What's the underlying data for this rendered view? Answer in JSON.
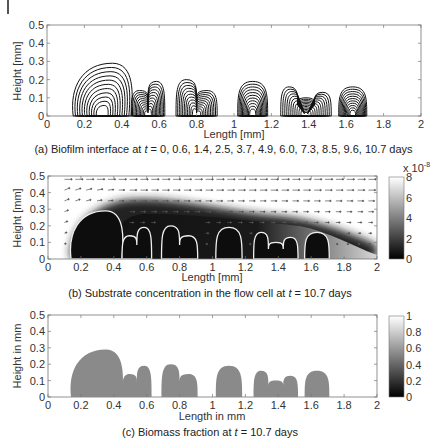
{
  "figure": {
    "panels": [
      {
        "id": "a",
        "caption_prefix": "(a) Biofilm interface at ",
        "caption_var": "t",
        "caption_suffix": " = 0, 0.6, 1.4, 2.5, 3.7, 4.9, 6.0, 7.3, 8.5, 9.6, 10.7 days",
        "xlabel": "Length [mm]",
        "ylabel": "Height [mm]",
        "xticks": [
          "0",
          "0.2",
          "0.4",
          "0.6",
          "0.8",
          "1",
          "1.2",
          "1.4",
          "1.6",
          "1.8",
          "2"
        ],
        "yticks": [
          "0",
          "0.1",
          "0.2",
          "0.3",
          "0.4",
          "0.5"
        ]
      },
      {
        "id": "b",
        "caption_prefix": "(b) Substrate concentration in the flow cell at ",
        "caption_var": "t",
        "caption_suffix": " = 10.7 days",
        "xlabel": "Length [mm]",
        "ylabel": "Height [mm]",
        "xticks": [
          "0",
          "0.2",
          "0.4",
          "0.6",
          "0.8",
          "1",
          "1.2",
          "1.4",
          "1.6",
          "1.8",
          "2"
        ],
        "yticks": [
          "0",
          "0.1",
          "0.2",
          "0.3",
          "0.4",
          "0.5"
        ],
        "colorbar": {
          "ticks": [
            "0",
            "2",
            "4",
            "6",
            "8"
          ],
          "multiplier": "x 10",
          "exponent": "-8"
        }
      },
      {
        "id": "c",
        "caption_prefix": "(c) Biomass fraction at ",
        "caption_var": "t",
        "caption_suffix": " = 10.7 days",
        "xlabel": "Length in mm",
        "ylabel": "Height in mm",
        "xticks": [
          "0",
          "0.2",
          "0.4",
          "0.6",
          "0.8",
          "1",
          "1.2",
          "1.4",
          "1.6",
          "1.8",
          "2"
        ],
        "yticks": [
          "0",
          "0.1",
          "0.2",
          "0.3",
          "0.4",
          "0.5"
        ],
        "colorbar": {
          "ticks": [
            "0",
            "0.2",
            "0.4",
            "0.6",
            "0.8",
            "1"
          ]
        }
      }
    ]
  },
  "chart_data": [
    {
      "type": "line",
      "title": "(a) Biofilm interface at t = 0, 0.6, 1.4, 2.5, 3.7, 4.9, 6.0, 7.3, 8.5, 9.6, 10.7 days",
      "xlabel": "Length [mm]",
      "ylabel": "Height [mm]",
      "xlim": [
        0,
        2
      ],
      "ylim": [
        0,
        0.5
      ],
      "grid": false,
      "series_times_days": [
        0,
        0.6,
        1.4,
        2.5,
        3.7,
        4.9,
        6.0,
        7.3,
        8.5,
        9.6,
        10.7
      ],
      "colonies_final": [
        {
          "x_range": [
            0.14,
            0.45
          ],
          "peak_x": 0.35,
          "peak_height": 0.29
        },
        {
          "x_range": [
            0.45,
            0.63
          ],
          "peaks": [
            [
              0.5,
              0.14
            ],
            [
              0.58,
              0.19
            ]
          ]
        },
        {
          "x_range": [
            0.69,
            0.91
          ],
          "peaks": [
            [
              0.76,
              0.2
            ],
            [
              0.86,
              0.14
            ]
          ]
        },
        {
          "x_range": [
            1.02,
            1.18
          ],
          "peak_x": 1.1,
          "peak_height": 0.19
        },
        {
          "x_range": [
            1.25,
            1.52
          ],
          "peaks": [
            [
              1.31,
              0.16
            ],
            [
              1.4,
              0.1
            ],
            [
              1.48,
              0.13
            ]
          ]
        },
        {
          "x_range": [
            1.56,
            1.71
          ],
          "peak_x": 1.63,
          "peak_height": 0.16
        }
      ]
    },
    {
      "type": "heatmap",
      "title": "(b) Substrate concentration in the flow cell at t = 10.7 days",
      "xlabel": "Length [mm]",
      "ylabel": "Height [mm]",
      "xlim": [
        0,
        2
      ],
      "ylim": [
        0,
        0.5
      ],
      "colorbar_range": [
        0,
        8e-08
      ],
      "colorbar_ticks": [
        0,
        2,
        4,
        6,
        8
      ],
      "colorbar_multiplier": "x 10^-8",
      "overlay": "velocity quiver field + white biofilm interface contour"
    },
    {
      "type": "heatmap",
      "title": "(c) Biomass fraction at t = 10.7 days",
      "xlabel": "Length in mm",
      "ylabel": "Height in mm",
      "xlim": [
        0,
        2
      ],
      "ylim": [
        0,
        0.5
      ],
      "colorbar_range": [
        0,
        1
      ],
      "colorbar_ticks": [
        0,
        0.2,
        0.4,
        0.6,
        0.8,
        1
      ],
      "biomass_value_in_colonies": 0.6
    }
  ]
}
